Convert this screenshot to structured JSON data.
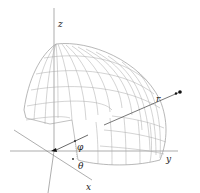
{
  "diagram": {
    "axes": {
      "x": {
        "label": "x"
      },
      "y": {
        "label": "y"
      },
      "z": {
        "label": "z"
      }
    },
    "vector": {
      "label": "r"
    },
    "angles": {
      "phi": {
        "label": "φ"
      },
      "theta": {
        "label": "θ"
      }
    },
    "colors": {
      "axis": "#555555",
      "mesh": "#9a9a9a",
      "vector": "#333333",
      "background": "#ffffff"
    }
  }
}
